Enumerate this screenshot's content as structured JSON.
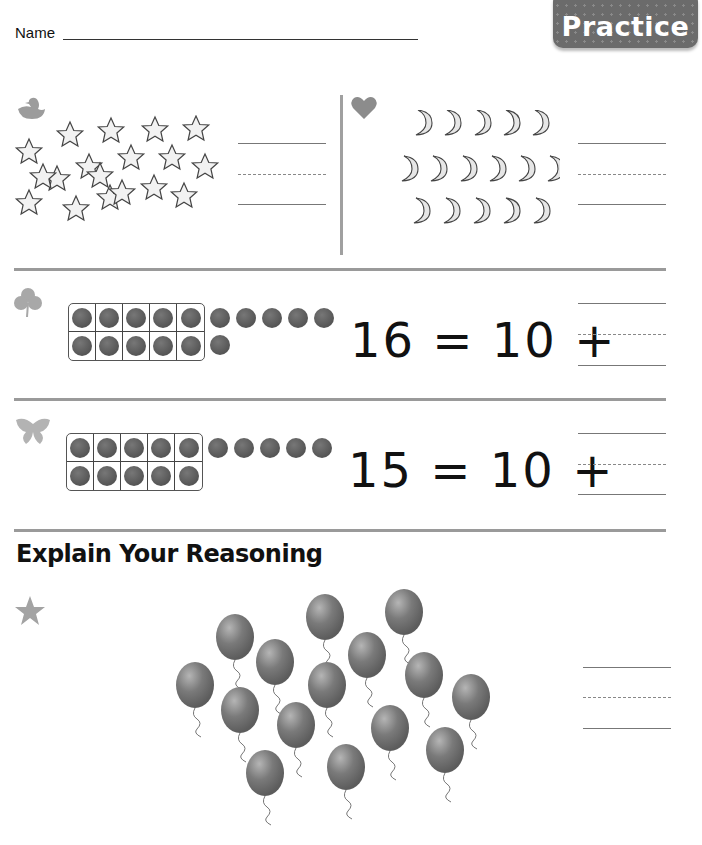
{
  "header": {
    "name_label": "Name",
    "badge_label": "Practice"
  },
  "colors": {
    "badge_bg": "#6b6b6b",
    "rule_gray": "#9a9a9a",
    "counter_fill": "#5a5a5a"
  },
  "problems": [
    {
      "marker_icon": "duck-icon",
      "object": "star",
      "count": 18,
      "answer_lines": 1
    },
    {
      "marker_icon": "heart-icon",
      "object": "moon",
      "rows": [
        5,
        6,
        5
      ],
      "count": 16,
      "answer_lines": 1
    },
    {
      "marker_icon": "clover-icon",
      "ten_frame_filled": 10,
      "extra_counters_row1": 5,
      "extra_counters_row2": 1,
      "equation": {
        "total": "16",
        "equals": "=",
        "ten": "10",
        "plus": "+"
      }
    },
    {
      "marker_icon": "butterfly-icon",
      "ten_frame_filled": 10,
      "extra_counters_row1": 5,
      "extra_counters_row2": 0,
      "equation": {
        "total": "15",
        "equals": "=",
        "ten": "10",
        "plus": "+"
      }
    }
  ],
  "reasoning": {
    "heading": "Explain Your Reasoning",
    "marker_icon": "star-icon",
    "object": "balloon",
    "count": 15
  }
}
